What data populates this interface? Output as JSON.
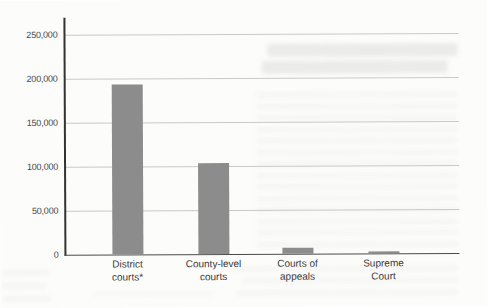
{
  "figure": {
    "background_color": "#fcfcfb",
    "bar_color": "#8c8c8c",
    "axis_color": "#333333",
    "gridline_color": "#c9c9c7",
    "label_color": "#3a3a3a"
  },
  "chart_data": {
    "type": "bar",
    "title": "",
    "xlabel": "",
    "ylabel": "",
    "categories": [
      "District courts*",
      "County-level courts",
      "Courts of appeals",
      "Supreme Court"
    ],
    "category_lines": [
      [
        "District",
        "courts*"
      ],
      [
        "County-level",
        "courts"
      ],
      [
        "Courts of",
        "appeals"
      ],
      [
        "Supreme",
        "Court"
      ]
    ],
    "values": [
      193000,
      103000,
      7000,
      2500
    ],
    "ylim": [
      0,
      250000
    ],
    "ytick_interval": 50000,
    "ytick_labels": [
      "0",
      "50,000",
      "100,000",
      "150,000",
      "200,000",
      "250,000"
    ],
    "grid": true,
    "legend": false
  }
}
